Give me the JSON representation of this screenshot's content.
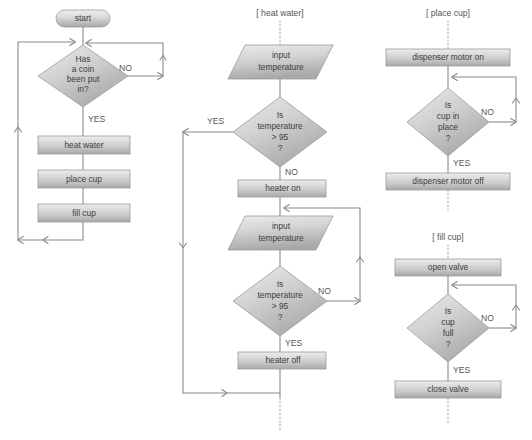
{
  "diagram": {
    "background_color": "#ffffff",
    "shape_fill_light": "#e4e4e4",
    "shape_fill_dark": "#a9a9a9",
    "shape_stroke": "#9b9b9b",
    "connector_color": "#8a8a8a",
    "text_color": "#4a4a4a"
  },
  "columns": {
    "main": {
      "name": "main-loop",
      "nodes": [
        {
          "id": "start",
          "type": "terminator",
          "label": "start"
        },
        {
          "id": "coin-check",
          "type": "decision",
          "label": "Has\na coin\nbeen put\nin?",
          "lines": [
            "Has",
            "a coin",
            "been put",
            "in?"
          ]
        },
        {
          "id": "heat-water",
          "type": "process",
          "label": "heat water"
        },
        {
          "id": "place-cup",
          "type": "process",
          "label": "place cup"
        },
        {
          "id": "fill-cup",
          "type": "process",
          "label": "fill cup"
        }
      ],
      "edge_labels": {
        "no": "NO",
        "yes": "YES"
      }
    },
    "heat_water": {
      "name": "heat-water-subroutine",
      "header": "[ heat water]",
      "nodes": [
        {
          "id": "input-temp-1",
          "type": "io",
          "label": "input temperature",
          "lines": [
            "input",
            "temperature"
          ]
        },
        {
          "id": "temp-check-1",
          "type": "decision",
          "label": "Is temperature > 95 ?",
          "lines": [
            "Is",
            "temperature",
            "> 95",
            "?"
          ]
        },
        {
          "id": "heater-on",
          "type": "process",
          "label": "heater on"
        },
        {
          "id": "input-temp-2",
          "type": "io",
          "label": "input temperature",
          "lines": [
            "input",
            "temperature"
          ]
        },
        {
          "id": "temp-check-2",
          "type": "decision",
          "label": "Is temperature > 95 ?",
          "lines": [
            "Is",
            "temperature",
            "> 95",
            "?"
          ]
        },
        {
          "id": "heater-off",
          "type": "process",
          "label": "heater off"
        }
      ],
      "edge_labels": {
        "yes_1": "YES",
        "no_1": "NO",
        "no_2": "NO",
        "yes_2": "YES"
      }
    },
    "place_cup": {
      "name": "place-cup-subroutine",
      "header": "[ place cup]",
      "nodes": [
        {
          "id": "dispenser-on",
          "type": "process",
          "label": "dispenser motor on"
        },
        {
          "id": "cup-in-place",
          "type": "decision",
          "label": "Is cup in place ?",
          "lines": [
            "Is",
            "cup in",
            "place",
            "?"
          ]
        },
        {
          "id": "dispenser-off",
          "type": "process",
          "label": "dispenser motor off"
        }
      ],
      "edge_labels": {
        "no": "NO",
        "yes": "YES"
      }
    },
    "fill_cup": {
      "name": "fill-cup-subroutine",
      "header": "[ fill cup]",
      "nodes": [
        {
          "id": "open-valve",
          "type": "process",
          "label": "open valve"
        },
        {
          "id": "cup-full",
          "type": "decision",
          "label": "Is cup full ?",
          "lines": [
            "Is",
            "cup",
            "full",
            "?"
          ]
        },
        {
          "id": "close-valve",
          "type": "process",
          "label": "close valve"
        }
      ],
      "edge_labels": {
        "no": "NO",
        "yes": "YES"
      }
    }
  }
}
